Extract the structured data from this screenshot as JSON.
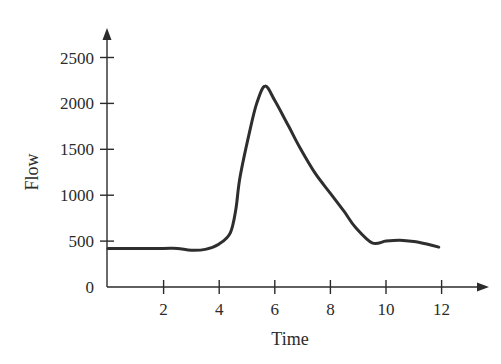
{
  "chart_data": {
    "type": "line",
    "title": "",
    "xlabel": "Time",
    "ylabel": "Flow",
    "xlim": [
      0,
      13
    ],
    "ylim": [
      0,
      2800
    ],
    "x_ticks": [
      2,
      4,
      6,
      8,
      10,
      12
    ],
    "x_tick_labels": [
      "2",
      "4",
      "6",
      "8",
      "10",
      "12"
    ],
    "y_ticks": [
      0,
      500,
      1000,
      1500,
      2000,
      2500
    ],
    "y_tick_labels": [
      "0",
      "500",
      "1000",
      "1500",
      "2000",
      "2500"
    ],
    "grid": false,
    "legend": null,
    "series": [
      {
        "name": "Flow",
        "color": "#2e2e2e",
        "x": [
          0,
          1,
          2,
          2.5,
          3,
          3.5,
          4,
          4.4,
          4.6,
          4.75,
          5.1,
          5.35,
          5.65,
          6,
          6.5,
          6.9,
          7.45,
          8,
          8.5,
          8.9,
          9.5,
          10,
          10.5,
          11,
          11.5,
          11.9
        ],
        "values": [
          420,
          420,
          420,
          420,
          400,
          410,
          470,
          590,
          850,
          1200,
          1700,
          2000,
          2190,
          2030,
          1750,
          1520,
          1240,
          1020,
          820,
          650,
          480,
          500,
          510,
          495,
          465,
          435
        ]
      }
    ]
  }
}
